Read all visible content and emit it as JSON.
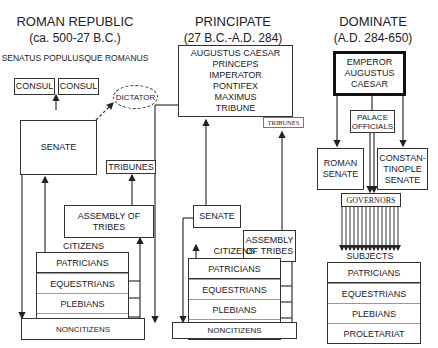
{
  "republic": {
    "title": "ROMAN REPUBLIC",
    "dates": "(ca. 500-27 B.C.)",
    "motto": "SENATUS POPULUSQUE ROMANUS",
    "consul_1": "CONSUL",
    "consul_2": "CONSUL",
    "dictator": "DICTATOR",
    "senate": "SENATE",
    "tribunes": "TRIBUNES",
    "assembly": "ASSEMBLY OF TRIBES",
    "citizens_label": "CITIZENS",
    "classes": [
      "PATRICIANS",
      "EQUESTRIANS",
      "PLEBIANS",
      "PROLETARIAT"
    ],
    "noncitizens": "NONCITIZENS"
  },
  "principate": {
    "title": "PRINCIPATE",
    "dates": "(27 B.C.-A.D. 284)",
    "ruler_lines": [
      "AUGUSTUS CAESAR",
      "PRINCEPS",
      "IMPERATOR",
      "PONTIFEX",
      "MAXIMUS",
      "TRIBUNE"
    ],
    "tribunes": "TRIBUNES",
    "senate": "SENATE",
    "assembly": "ASSEMBLY OF TRIBES",
    "citizens_label": "CITIZENS",
    "classes": [
      "PATRICIANS",
      "EQUESTRIANS",
      "PLEBIANS",
      "PROLETARIAT"
    ],
    "noncitizens": "NONCITIZENS"
  },
  "dominate": {
    "title": "DOMINATE",
    "dates": "(A.D. 284-650)",
    "emperor": "EMPEROR AUGUSTUS CAESAR",
    "palace_officials": "PALACE OFFICIALS",
    "roman_senate": "ROMAN SENATE",
    "constantinople_senate": "CONSTAN-TINOPLE SENATE",
    "governors": "GOVERNORS",
    "subjects_label": "SUBJECTS",
    "classes": [
      "PATRICIANS",
      "EQUESTRIANS",
      "PLEBIANS",
      "PROLETARIAT"
    ]
  }
}
